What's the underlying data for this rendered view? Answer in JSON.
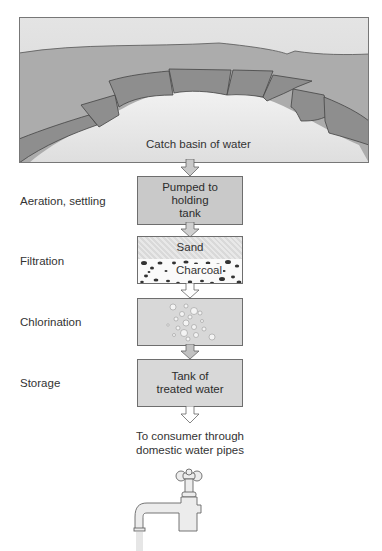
{
  "diagram": {
    "source": {
      "label": "Catch basin of water"
    },
    "steps": [
      {
        "stage": "Aeration, settling",
        "box_text": [
          "Pumped to",
          "holding",
          "tank"
        ]
      },
      {
        "stage": "Filtration",
        "layers": [
          "Sand",
          "Charcoal"
        ]
      },
      {
        "stage": "Chlorination",
        "box_text": []
      },
      {
        "stage": "Storage",
        "box_text": [
          "Tank of",
          "treated water"
        ]
      }
    ],
    "destination": {
      "lines": [
        "To consumer through",
        "domestic water pipes"
      ],
      "icon": "water-faucet-icon"
    },
    "colors": {
      "sky": "#dcdcdc",
      "land": "#a9a9a9",
      "basin_wall": "#8a8a8a",
      "water": "#e6e6e6",
      "box_fill": "#c9c9c9",
      "outline": "#555555"
    }
  }
}
